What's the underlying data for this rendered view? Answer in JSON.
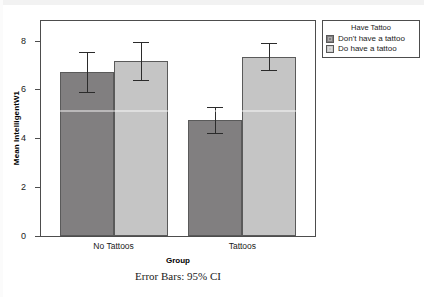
{
  "chart_data": {
    "type": "bar",
    "title": "",
    "xlabel": "Group",
    "ylabel": "Mean IntelligentW1",
    "categories": [
      "No Tattoos",
      "Tattoos"
    ],
    "ylim": [
      0,
      8.8
    ],
    "yticks": [
      0,
      2,
      4,
      6,
      8
    ],
    "ytick_labels": [
      "0",
      "2",
      "4",
      "6",
      "8"
    ],
    "grid": false,
    "legend_position": "right",
    "legend_title": "Have Tattoo",
    "error_bar_note": "Error Bars: 95% CI",
    "series": [
      {
        "name": "Don't have a tattoo",
        "color": "#817f80",
        "values": [
          6.72,
          4.75
        ],
        "ci_low": [
          5.88,
          4.2
        ],
        "ci_high": [
          7.55,
          5.3
        ]
      },
      {
        "name": "Do have a tattoo",
        "color": "#c5c5c5",
        "values": [
          7.18,
          7.33
        ],
        "ci_low": [
          6.4,
          6.78
        ],
        "ci_high": [
          7.93,
          7.92
        ]
      }
    ]
  },
  "axes": {
    "y_title": "Mean IntelligentW1",
    "x_title": "Group",
    "tick_0": "0",
    "tick_2": "2",
    "tick_4": "4",
    "tick_6": "6",
    "tick_8": "8",
    "cat_0": "No Tattoos",
    "cat_1": "Tattoos"
  },
  "legend": {
    "title": "Have Tattoo",
    "items": [
      {
        "label": "Don't have a tattoo",
        "color": "#817f80"
      },
      {
        "label": "Do have a tattoo",
        "color": "#c9c9c9"
      }
    ]
  },
  "footnote": "Error Bars: 95% CI"
}
